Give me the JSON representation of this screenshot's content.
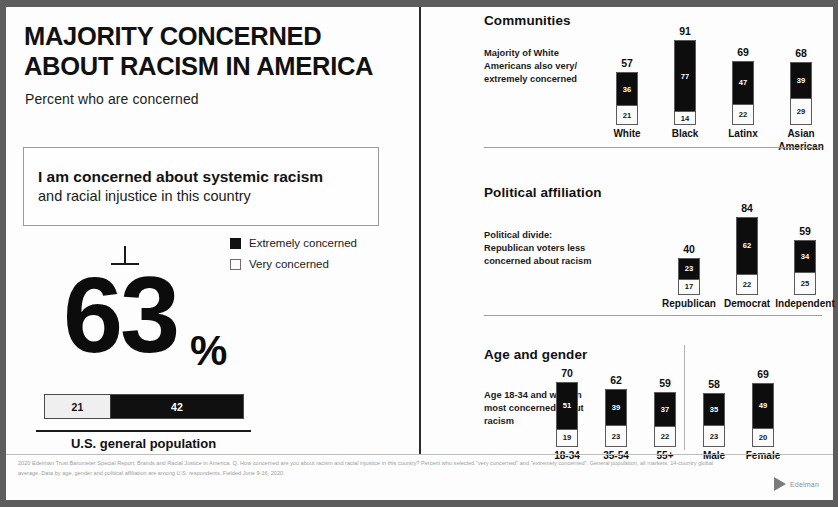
{
  "left": {
    "headline": "MAJORITY CONCERNED ABOUT RACISM IN AMERICA",
    "subhead": "Percent who are concerned",
    "statement_bold": "I am concerned about systemic racism",
    "statement_regular": "and racial injustice in this country",
    "legend": [
      {
        "label": "Extremely concerned",
        "swatch": "dark"
      },
      {
        "label": "Very concerned",
        "swatch": "light"
      }
    ],
    "big_number": "63",
    "big_number_unit": "%",
    "hero_bar": {
      "light_value": "21",
      "dark_value": "42"
    },
    "caption": "U.S. general population"
  },
  "right": {
    "sections": [
      {
        "title": "Communities",
        "note": "Majority of White Americans also very/ extremely concerned",
        "bars": [
          {
            "label": "White",
            "total": "57",
            "dark": "36",
            "light": "21"
          },
          {
            "label": "Black",
            "total": "91",
            "dark": "77",
            "light": "14"
          },
          {
            "label": "Latinx",
            "total": "69",
            "dark": "47",
            "light": "22"
          },
          {
            "label": "Asian American",
            "total": "68",
            "dark": "39",
            "light": "29"
          }
        ]
      },
      {
        "title": "Political affiliation",
        "note": "Political divide: Republican voters less concerned about racism",
        "bars": [
          {
            "label": "Republican",
            "total": "40",
            "dark": "23",
            "light": "17"
          },
          {
            "label": "Democrat",
            "total": "84",
            "dark": "62",
            "light": "22"
          },
          {
            "label": "Independent",
            "total": "59",
            "dark": "34",
            "light": "25"
          }
        ]
      },
      {
        "title": "Age and gender",
        "note": "Age 18-34 and women most concerned about racism",
        "bars": [
          {
            "label": "18-34",
            "total": "70",
            "dark": "51",
            "light": "19"
          },
          {
            "label": "35-54",
            "total": "62",
            "dark": "39",
            "light": "23"
          },
          {
            "label": "55+",
            "total": "59",
            "dark": "37",
            "light": "22"
          },
          {
            "label": "Male",
            "total": "58",
            "dark": "35",
            "light": "23"
          },
          {
            "label": "Female",
            "total": "69",
            "dark": "49",
            "light": "20"
          }
        ]
      }
    ]
  },
  "footer": {
    "footnote": "2020 Edelman Trust Barometer Special Report: Brands and Racial Justice in America. Q. How concerned are you about racism and racial injustice in this country? Percent who selected \"very concerned\" and \"extremely concerned\". General population, all markets, 14-country global average. Data by age, gender and political affiliation are among U.S. respondents. Fielded June 9-16, 2020.",
    "logo_word": "Edelman"
  },
  "chart_data": [
    {
      "type": "bar",
      "title": "I am concerned about systemic racism and racial injustice in this country",
      "subtitle": "Percent who are concerned",
      "categories": [
        "U.S. general population"
      ],
      "series": [
        {
          "name": "Very concerned",
          "values": [
            21
          ]
        },
        {
          "name": "Extremely concerned",
          "values": [
            42
          ]
        }
      ],
      "totals": [
        63
      ],
      "xlabel": "",
      "ylabel": "Percent",
      "ylim": [
        0,
        100
      ],
      "grid": false,
      "legend": "top-right",
      "stacked": true,
      "orientation": "horizontal"
    },
    {
      "type": "bar",
      "title": "Communities",
      "annotation": "Majority of White Americans also very/extremely concerned",
      "categories": [
        "White",
        "Black",
        "Latinx",
        "Asian American"
      ],
      "series": [
        {
          "name": "Extremely concerned",
          "values": [
            36,
            77,
            47,
            39
          ]
        },
        {
          "name": "Very concerned",
          "values": [
            21,
            14,
            22,
            29
          ]
        }
      ],
      "totals": [
        57,
        91,
        69,
        68
      ],
      "xlabel": "",
      "ylabel": "Percent",
      "ylim": [
        0,
        100
      ],
      "grid": false,
      "stacked": true,
      "orientation": "vertical"
    },
    {
      "type": "bar",
      "title": "Political affiliation",
      "annotation": "Political divide: Republican voters less concerned about racism",
      "categories": [
        "Republican",
        "Democrat",
        "Independent"
      ],
      "series": [
        {
          "name": "Extremely concerned",
          "values": [
            23,
            62,
            34
          ]
        },
        {
          "name": "Very concerned",
          "values": [
            17,
            22,
            25
          ]
        }
      ],
      "totals": [
        40,
        84,
        59
      ],
      "xlabel": "",
      "ylabel": "Percent",
      "ylim": [
        0,
        100
      ],
      "grid": false,
      "stacked": true,
      "orientation": "vertical"
    },
    {
      "type": "bar",
      "title": "Age and gender",
      "annotation": "Age 18-34 and women most concerned about racism",
      "categories": [
        "18-34",
        "35-54",
        "55+",
        "Male",
        "Female"
      ],
      "series": [
        {
          "name": "Extremely concerned",
          "values": [
            51,
            39,
            37,
            35,
            49
          ]
        },
        {
          "name": "Very concerned",
          "values": [
            19,
            23,
            22,
            23,
            20
          ]
        }
      ],
      "totals": [
        70,
        62,
        59,
        58,
        69
      ],
      "xlabel": "",
      "ylabel": "Percent",
      "ylim": [
        0,
        100
      ],
      "grid": false,
      "stacked": true,
      "orientation": "vertical"
    }
  ]
}
